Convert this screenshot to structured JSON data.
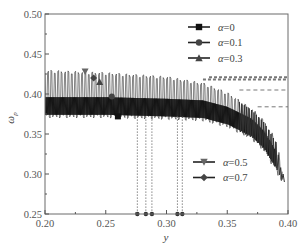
{
  "chart_data": {
    "type": "line",
    "title": "",
    "xlabel": "y",
    "ylabel": "ω_p",
    "xlim": [
      0.2,
      0.4
    ],
    "ylim": [
      0.25,
      0.5
    ],
    "x_ticks": [
      "0.20",
      "0.25",
      "0.30",
      "0.35",
      "0.40"
    ],
    "y_ticks": [
      "0.25",
      "0.30",
      "0.35",
      "0.40",
      "0.45",
      "0.50"
    ],
    "grid": false,
    "legend_position": "upper-right (α=0, 0.1, 0.3) and lower-right (α=0.5, 0.7)",
    "series": [
      {
        "name": "α=0",
        "marker": "square",
        "band_center": 0.384,
        "plateau_level": 0.384,
        "critical_y": 0.313,
        "marker_point": [
          0.26,
          0.372
        ]
      },
      {
        "name": "α=0.1",
        "marker": "circle",
        "band_center": 0.392,
        "plateau_level": 0.405,
        "critical_y": 0.309,
        "marker_point": [
          0.255,
          0.397
        ]
      },
      {
        "name": "α=0.3",
        "marker": "triangle-up",
        "band_center": 0.4,
        "plateau_level": 0.418,
        "critical_y": 0.288,
        "marker_point": [
          0.245,
          0.415
        ]
      },
      {
        "name": "α=0.5",
        "marker": "triangle-down",
        "band_center": 0.405,
        "plateau_level": 0.418,
        "critical_y": 0.283,
        "marker_point": [
          0.233,
          0.428
        ]
      },
      {
        "name": "α=0.7",
        "marker": "diamond",
        "band_center": 0.41,
        "plateau_level": 0.421,
        "critical_y": 0.276,
        "marker_point": [
          0.24,
          0.42
        ]
      }
    ],
    "envelope": {
      "description": "Dense oscillating band for all α; upper edge ≈0.425 at y=0.20 declining to ≈0.29 at y=0.395; lower edge ≈0.372 at y=0.20",
      "x": [
        0.2,
        0.25,
        0.3,
        0.33,
        0.35,
        0.37,
        0.38,
        0.39,
        0.395
      ],
      "upper": [
        0.428,
        0.425,
        0.42,
        0.412,
        0.4,
        0.38,
        0.365,
        0.34,
        0.3
      ],
      "lower": [
        0.372,
        0.372,
        0.37,
        0.368,
        0.36,
        0.345,
        0.33,
        0.305,
        0.29
      ]
    },
    "annotations": {
      "horizontal_dashed_lines": [
        0.421,
        0.418,
        0.405,
        0.384
      ],
      "vertical_dotted_lines": [
        0.276,
        0.283,
        0.288,
        0.309,
        0.313
      ]
    }
  },
  "legend": {
    "top": [
      {
        "label": "α=0",
        "marker": "square"
      },
      {
        "label": "α=0.1",
        "marker": "circle"
      },
      {
        "label": "α=0.3",
        "marker": "triangle-up"
      }
    ],
    "bottom": [
      {
        "label": "α=0.5",
        "marker": "triangle-down"
      },
      {
        "label": "α=0.7",
        "marker": "diamond"
      }
    ]
  },
  "axes": {
    "xlabel": "y",
    "ylabel": "ω",
    "ylabel_sub": "p"
  }
}
